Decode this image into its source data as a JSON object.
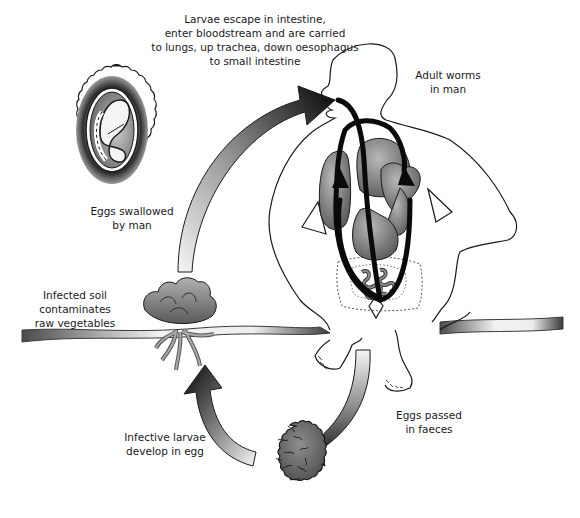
{
  "diagram": {
    "stages": [
      {
        "id": "larvae-migration",
        "label": "Larvae escape in intestine,\nenter bloodstream and are carried\nto lungs, up trachea, down oesophagus\nto small intestine"
      },
      {
        "id": "adult-worms",
        "label": "Adult worms\nin man"
      },
      {
        "id": "eggs-swallowed",
        "label": "Eggs swallowed\nby man"
      },
      {
        "id": "infected-soil",
        "label": "Infected soil\ncontaminates\nraw vegetables"
      },
      {
        "id": "eggs-passed",
        "label": "Eggs passed\nin faeces"
      },
      {
        "id": "larvae-develop",
        "label": "Infective larvae\ndevelop in egg"
      }
    ],
    "illustrations": [
      {
        "id": "embryonated-egg",
        "description": "Egg with coiled larva inside, scalloped outer shell"
      },
      {
        "id": "human-figure",
        "description": "Seated man outline with lungs, heart, stomach and intestine"
      },
      {
        "id": "lettuce",
        "description": "Lettuce growing from soil with roots"
      },
      {
        "id": "unembryonated-egg",
        "description": "Rough-shelled egg in soil"
      },
      {
        "id": "ground",
        "description": "Soil surface band"
      }
    ],
    "arrows": [
      {
        "from": "lettuce",
        "to": "mouth",
        "style": "gradient-dark-tip"
      },
      {
        "from": "human-figure",
        "to": "unembryonated-egg",
        "style": "gradient-dark-tip"
      },
      {
        "from": "unembryonated-egg",
        "to": "lettuce",
        "style": "gradient-dark-tip"
      },
      {
        "from": "intestine",
        "to": "lungs",
        "style": "black-migration-loops"
      }
    ],
    "colors": {
      "ink": "#1a1a1a",
      "organ_fill": "#7a7a7a",
      "organ_light": "#a8a8a8",
      "arrow_dark": "#0a0a0a",
      "arrow_light": "#f4f4f4",
      "background": "#ffffff"
    }
  }
}
